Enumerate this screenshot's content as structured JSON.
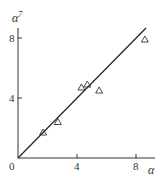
{
  "chart_data": {
    "type": "scatter",
    "title": "",
    "xlabel": "α",
    "ylabel": "α⁷",
    "xlim": [
      0,
      9
    ],
    "ylim": [
      0,
      9
    ],
    "x_ticks": [
      0,
      4,
      8
    ],
    "y_ticks": [
      4,
      8
    ],
    "origin_label": "0",
    "grid": false,
    "legend": null,
    "series": [
      {
        "name": "measured",
        "marker": "triangle-open",
        "points": [
          {
            "x": 1.7,
            "y": 1.7
          },
          {
            "x": 2.7,
            "y": 2.4
          },
          {
            "x": 4.3,
            "y": 4.7
          },
          {
            "x": 4.7,
            "y": 4.9
          },
          {
            "x": 5.5,
            "y": 4.5
          },
          {
            "x": 8.6,
            "y": 7.9
          }
        ]
      },
      {
        "name": "y = x",
        "type": "line",
        "points": [
          {
            "x": 0,
            "y": 0
          },
          {
            "x": 8.7,
            "y": 8.7
          }
        ]
      }
    ]
  },
  "labels": {
    "x_axis": "α",
    "y_axis_base": "α",
    "y_axis_sup": "7",
    "origin": "0",
    "x_tick_4": "4",
    "x_tick_8": "8",
    "y_tick_4": "4",
    "y_tick_8": "8"
  }
}
